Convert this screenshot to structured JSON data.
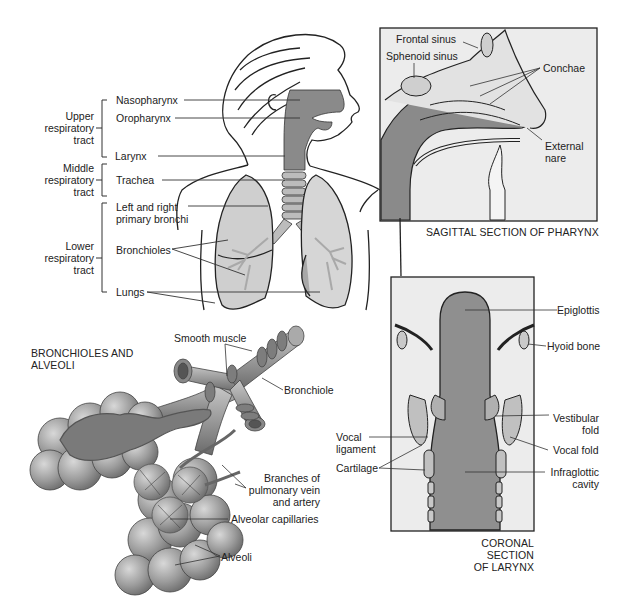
{
  "figure": {
    "regions": {
      "upper": {
        "label_line1": "Upper",
        "label_line2": "respiratory",
        "label_line3": "tract"
      },
      "middle": {
        "label_line1": "Middle",
        "label_line2": "respiratory",
        "label_line3": "tract"
      },
      "lower": {
        "label_line1": "Lower",
        "label_line2": "respiratory",
        "label_line3": "tract"
      }
    },
    "body_labels": {
      "nasopharynx": "Nasopharynx",
      "oropharynx": "Oropharynx",
      "larynx": "Larynx",
      "trachea": "Trachea",
      "bronchi_line1": "Left and right",
      "bronchi_line2": "primary bronchi",
      "bronchioles": "Bronchioles",
      "lungs": "Lungs"
    },
    "sagittal_panel": {
      "caption": "SAGITTAL SECTION OF PHARYNX",
      "labels": {
        "frontal_sinus": "Frontal sinus",
        "sphenoid_sinus": "Sphenoid sinus",
        "conchae": "Conchae",
        "external_nare_line1": "External",
        "external_nare_line2": "nare"
      }
    },
    "larynx_panel": {
      "caption_line1": "CORONAL SECTION",
      "caption_line2": "OF LARYNX",
      "labels": {
        "epiglottis": "Epiglottis",
        "hyoid_bone": "Hyoid bone",
        "vestibular_fold_line1": "Vestibular",
        "vestibular_fold_line2": "fold",
        "vocal_fold": "Vocal fold",
        "infraglottic_line1": "Infraglottic",
        "infraglottic_line2": "cavity",
        "vocal_ligament_line1": "Vocal",
        "vocal_ligament_line2": "ligament",
        "cartilage": "Cartilage"
      }
    },
    "alveoli_panel": {
      "caption_line1": "BRONCHIOLES AND",
      "caption_line2": "ALVEOLI",
      "labels": {
        "smooth_muscle": "Smooth muscle",
        "bronchiole": "Bronchiole",
        "branches_line1": "Branches of",
        "branches_line2": "pulmonary vein",
        "branches_line3": "and artery",
        "alveolar_capillaries": "Alveolar capillaries",
        "alveoli": "Alveoli"
      }
    },
    "colors": {
      "airway_fill": "#8a8a8a",
      "lung_fill": "#cfcfcf",
      "panel_bg": "#ececec",
      "line": "#222222"
    }
  }
}
